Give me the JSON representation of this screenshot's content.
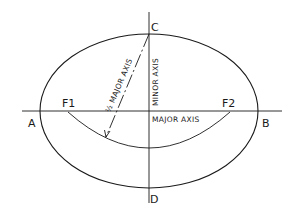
{
  "diagram": {
    "type": "ellipse-construction",
    "points": {
      "a": "A",
      "b": "B",
      "c": "C",
      "d": "D",
      "f1": "F1",
      "f2": "F2"
    },
    "labels": {
      "major_axis": "MAJOR AXIS",
      "minor_axis": "MINOR AXIS",
      "half_major_axis": "½ MAJOR AXIS"
    },
    "colors": {
      "line": "#1a1a1a",
      "background": "#ffffff"
    }
  }
}
